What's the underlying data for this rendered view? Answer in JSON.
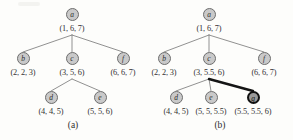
{
  "figure": {
    "type": "tree-diagram-pair",
    "panels": [
      {
        "id": "a",
        "caption": "(a)",
        "nodes": [
          {
            "id": "a",
            "letter": "a",
            "interval": "(1, 6, 7)",
            "highlighted": false,
            "x": 72,
            "y": 14,
            "label_x": 72,
            "label_y": 28
          },
          {
            "id": "b",
            "letter": "b",
            "interval": "(2, 2, 3)",
            "highlighted": false,
            "x": 23,
            "y": 58,
            "label_x": 23,
            "label_y": 72
          },
          {
            "id": "c",
            "letter": "c",
            "interval": "(3, 5, 6)",
            "highlighted": false,
            "x": 72,
            "y": 58,
            "label_x": 72,
            "label_y": 72
          },
          {
            "id": "f",
            "letter": "f",
            "interval": "(6, 6, 7)",
            "highlighted": false,
            "x": 123,
            "y": 58,
            "label_x": 123,
            "label_y": 72
          },
          {
            "id": "d",
            "letter": "d",
            "interval": "(4, 4, 5)",
            "highlighted": false,
            "x": 51,
            "y": 97,
            "label_x": 51,
            "label_y": 111
          },
          {
            "id": "e",
            "letter": "e",
            "interval": "(5, 5, 6)",
            "highlighted": false,
            "x": 100,
            "y": 97,
            "label_x": 100,
            "label_y": 111
          }
        ],
        "edges": [
          {
            "from": "a",
            "to": "b",
            "highlighted": false
          },
          {
            "from": "a",
            "to": "c",
            "highlighted": false
          },
          {
            "from": "a",
            "to": "f",
            "highlighted": false
          },
          {
            "from": "c",
            "to": "d",
            "highlighted": false
          },
          {
            "from": "c",
            "to": "e",
            "highlighted": false
          }
        ]
      },
      {
        "id": "b",
        "caption": "(b)",
        "nodes": [
          {
            "id": "a",
            "letter": "a",
            "interval": "(1, 6, 7)",
            "highlighted": false,
            "x": 62,
            "y": 14,
            "label_x": 62,
            "label_y": 28
          },
          {
            "id": "b",
            "letter": "b",
            "interval": "(2, 2, 3)",
            "highlighted": false,
            "x": 17,
            "y": 58,
            "label_x": 17,
            "label_y": 72
          },
          {
            "id": "c",
            "letter": "c",
            "interval": "(3, 5.5, 6)",
            "highlighted": false,
            "x": 62,
            "y": 58,
            "label_x": 62,
            "label_y": 72
          },
          {
            "id": "f",
            "letter": "f",
            "interval": "(6, 6, 7)",
            "highlighted": false,
            "x": 117,
            "y": 58,
            "label_x": 117,
            "label_y": 72
          },
          {
            "id": "d",
            "letter": "d",
            "interval": "(4, 4, 5)",
            "highlighted": false,
            "x": 29,
            "y": 97,
            "label_x": 29,
            "label_y": 111
          },
          {
            "id": "e",
            "letter": "e",
            "interval": "(5, 5, 5.5)",
            "highlighted": false,
            "x": 64,
            "y": 97,
            "label_x": 64,
            "label_y": 111
          },
          {
            "id": "g",
            "letter": "g",
            "interval": "(5.5, 5.5, 6)",
            "highlighted": true,
            "x": 106,
            "y": 97,
            "label_x": 106,
            "label_y": 111
          }
        ],
        "edges": [
          {
            "from": "a",
            "to": "b",
            "highlighted": false
          },
          {
            "from": "a",
            "to": "c",
            "highlighted": false
          },
          {
            "from": "a",
            "to": "f",
            "highlighted": false
          },
          {
            "from": "c",
            "to": "d",
            "highlighted": false
          },
          {
            "from": "c",
            "to": "e",
            "highlighted": false
          },
          {
            "from": "c",
            "to": "g",
            "highlighted": true
          }
        ]
      }
    ],
    "colors": {
      "node_fill": "#c9c9c9",
      "node_stroke": "#6e6e6e",
      "highlight_fill": "#9a9a9a",
      "highlight_stroke": "#111111",
      "edge": "#7d7d7d",
      "highlight_edge": "#151515",
      "text": "#333333",
      "background": "#fdfdfb"
    }
  }
}
